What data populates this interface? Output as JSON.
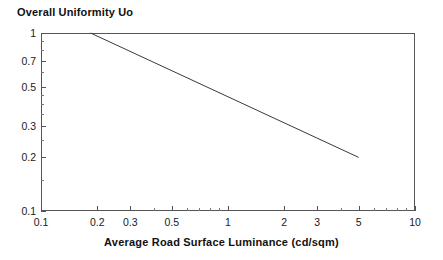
{
  "chart_data": {
    "type": "line",
    "title": "Overall Uniformity Uo",
    "xlabel": "Average Road Surface Luminance (cd/sqm)",
    "ylabel": "",
    "xscale": "log",
    "yscale": "log",
    "xlim": [
      0.1,
      10
    ],
    "ylim": [
      0.1,
      1
    ],
    "grid": false,
    "legend": false,
    "xticks": [
      0.1,
      0.2,
      0.3,
      0.5,
      1,
      2,
      3,
      5,
      10
    ],
    "xtick_labels": [
      "0.1",
      "0.2",
      "0.3",
      "0.5",
      "1",
      "2",
      "3",
      "5",
      "10"
    ],
    "yticks": [
      0.1,
      0.2,
      0.3,
      0.5,
      0.7,
      1
    ],
    "ytick_labels": [
      "0.1",
      "0.2",
      "0.3",
      "0.5",
      "0.7",
      "1"
    ],
    "x_minor_ticks": [
      0.4,
      0.6,
      0.7,
      0.8,
      0.9,
      4,
      6,
      7,
      8,
      9
    ],
    "y_minor_ticks": [
      0.15,
      0.25,
      0.35,
      0.4,
      0.45,
      0.6,
      0.8,
      0.9
    ],
    "series": [
      {
        "name": "Uo limit",
        "color": "#3a3a3a",
        "width": 1,
        "points": [
          {
            "x": 0.184,
            "y": 1.0
          },
          {
            "x": 5.0,
            "y": 0.2
          }
        ]
      }
    ]
  },
  "figure": {
    "background": "#ffffff",
    "frame_color": "#555555",
    "text_color": "#1a1a1a"
  }
}
